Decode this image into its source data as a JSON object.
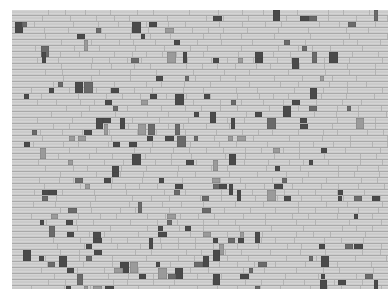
{
  "image": {
    "subject": "woven-textile-photograph",
    "description": "Grayscale photograph of a woven fabric with horizontal light weft bands and scattered dark rectangular floats",
    "background_color": "#ffffff",
    "fabric_bounds": {
      "x": 12,
      "y": 10,
      "width": 376,
      "height": 279
    },
    "row_height": 6,
    "colors": {
      "weft_light": "#d4d4d4",
      "weft_shadow": "#a9a9a9",
      "float_dark": "#4a4a4a",
      "float_mid": "#6a6a6a",
      "float_light": "#9a9a9a"
    },
    "pattern_seed": 7,
    "density_top": 0.1,
    "density_bottom": 0.22
  }
}
